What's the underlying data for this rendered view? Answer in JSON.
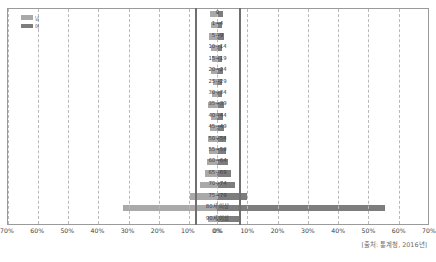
{
  "chart_data": {
    "type": "bar",
    "title": "",
    "subtitle": "",
    "orientation": "horizontal-diverging",
    "chart_kind": "population-pyramid",
    "xlabel": "",
    "ylabel": "",
    "categories": [
      "0",
      "1~4",
      "5~9",
      "10~14",
      "15~19",
      "20~24",
      "25~29",
      "30~34",
      "35~39",
      "40~44",
      "45~49",
      "50~54",
      "55~59",
      "60~64",
      "65~69",
      "70~74",
      "75~79",
      "80세 이상",
      "90세 이상"
    ],
    "series": [
      {
        "name": "남",
        "side": "left",
        "color": "#a9a9a9",
        "axis_direction": "right-to-left",
        "values": [
          2.6,
          2.3,
          3.0,
          2.3,
          2.1,
          2.4,
          1.8,
          2.0,
          3.3,
          2.2,
          2.8,
          3.4,
          2.9,
          3.8,
          4.2,
          6.0,
          9.3,
          31.5,
          3.3
        ]
      },
      {
        "name": "여",
        "side": "right",
        "color": "#7d7d7d",
        "axis_direction": "left-to-right",
        "values": [
          2.1,
          1.8,
          2.2,
          1.8,
          1.6,
          1.9,
          1.5,
          1.7,
          2.4,
          1.9,
          2.3,
          2.9,
          3.1,
          3.6,
          4.6,
          6.0,
          9.8,
          55.5,
          8.0
        ]
      }
    ],
    "xlim_left": [
      0,
      70
    ],
    "xlim_right": [
      0,
      70
    ],
    "xticks_left": [
      "70%",
      "60%",
      "50%",
      "40%",
      "30%",
      "20%",
      "10%",
      "0%"
    ],
    "xticks_right": [
      "0%",
      "10%",
      "20%",
      "30%",
      "40%",
      "50%",
      "60%",
      "70%"
    ],
    "xtick_values": [
      0,
      10,
      20,
      30,
      40,
      50,
      60,
      70
    ],
    "grid": true,
    "grid_style": "dashed",
    "legend_position": "top-left"
  },
  "legend": {
    "items": [
      {
        "label": "남",
        "color": "#a9a9a9"
      },
      {
        "label": "여",
        "color": "#7d7d7d"
      }
    ]
  },
  "source": {
    "text": "[출처: 통계청, 2016년]"
  },
  "colors": {
    "left_bar": "#a9a9a9",
    "right_bar": "#7d7d7d",
    "grid": "#b9b9b9",
    "frame": "#9a9a9a",
    "spine": "#6f6f6f",
    "text": "#3d3d3d",
    "source_text": "#6a6a6a",
    "background": "#ffffff"
  }
}
